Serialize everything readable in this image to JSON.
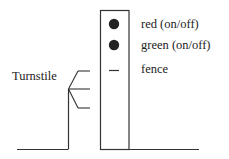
{
  "diagram": {
    "turnstile_label": "Turnstile",
    "legend": [
      {
        "symbol": "red-dot",
        "label": "red (on/off)"
      },
      {
        "symbol": "green-dot",
        "label": "green (on/off)"
      },
      {
        "symbol": "dash",
        "label": "fence"
      }
    ],
    "colors": {
      "line": "#333333",
      "dot": "#222222"
    }
  }
}
